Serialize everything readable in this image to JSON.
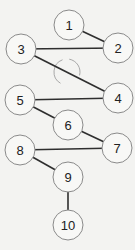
{
  "diagram": {
    "type": "graph",
    "colors": {
      "background": "#f3f3f1",
      "edge": "#2e2e2e",
      "node_stroke": "#8a8a8a",
      "node_fill": "#f8f8f6",
      "arc": "#a8a8a8",
      "label": "#222222"
    },
    "node_radius": 15,
    "nodes": [
      {
        "id": "1",
        "label": "1",
        "x": 69,
        "y": 25
      },
      {
        "id": "2",
        "label": "2",
        "x": 118,
        "y": 48
      },
      {
        "id": "3",
        "label": "3",
        "x": 21,
        "y": 49
      },
      {
        "id": "4",
        "label": "4",
        "x": 118,
        "y": 98
      },
      {
        "id": "5",
        "label": "5",
        "x": 20,
        "y": 100
      },
      {
        "id": "6",
        "label": "6",
        "x": 68,
        "y": 125
      },
      {
        "id": "7",
        "label": "7",
        "x": 117,
        "y": 148
      },
      {
        "id": "8",
        "label": "8",
        "x": 20,
        "y": 150
      },
      {
        "id": "9",
        "label": "9",
        "x": 68,
        "y": 177
      },
      {
        "id": "10",
        "label": "10",
        "x": 68,
        "y": 225
      }
    ],
    "edges": [
      {
        "from": "1",
        "to": "2"
      },
      {
        "from": "3",
        "to": "2"
      },
      {
        "from": "3",
        "to": "4"
      },
      {
        "from": "5",
        "to": "4"
      },
      {
        "from": "5",
        "to": "6"
      },
      {
        "from": "6",
        "to": "7"
      },
      {
        "from": "8",
        "to": "7"
      },
      {
        "from": "8",
        "to": "9"
      },
      {
        "from": "9",
        "to": "10"
      }
    ],
    "annotation_arc": {
      "cx": 67,
      "cy": 72,
      "r": 13
    }
  }
}
